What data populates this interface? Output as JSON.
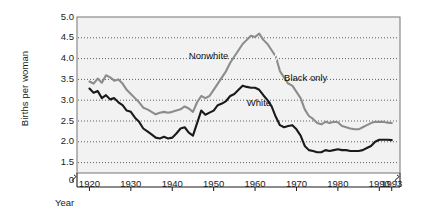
{
  "chart_data": {
    "type": "line",
    "title": "",
    "xlabel": "Year",
    "ylabel": "Births per woman",
    "xlim": [
      1917,
      1995
    ],
    "ylim": [
      1.25,
      5.0
    ],
    "grid": true,
    "legend_position": "inline-annotations",
    "y_axis_break": true,
    "x_ticks": [
      1920,
      1930,
      1940,
      1950,
      1960,
      1970,
      1980,
      1990,
      1993
    ],
    "x_tick_labels": [
      "1920",
      "1930",
      "1940",
      "1950",
      "1960",
      "1970",
      "1980",
      "1990",
      "1993"
    ],
    "y_ticks": [
      0,
      1.5,
      2.0,
      2.5,
      3.0,
      3.5,
      4.0,
      4.5,
      5.0
    ],
    "y_tick_labels": [
      "0",
      "1.5",
      "2.0",
      "2.5",
      "3.0",
      "3.5",
      "4.0",
      "4.5",
      "5.0"
    ],
    "annotations": [
      {
        "text": "Nonwhite",
        "x": 1944,
        "y": 4.05
      },
      {
        "text": "Black only",
        "x": 1967,
        "y": 3.52
      },
      {
        "text": "White",
        "x": 1958,
        "y": 2.92
      }
    ],
    "colors": {
      "nonwhite_black": "#8c8c8c",
      "white": "#1a1a1a",
      "plot_background": "#f2f2f2",
      "grid": "#4d4d4d",
      "frame": "#808080"
    },
    "series": [
      {
        "name": "Nonwhite / Black only",
        "color": "#8c8c8c",
        "note": "Series switches definition from Nonwhite to Black only at 1965 (break mark on line)",
        "x": [
          1920,
          1921,
          1922,
          1923,
          1924,
          1925,
          1926,
          1927,
          1928,
          1929,
          1930,
          1931,
          1932,
          1933,
          1934,
          1935,
          1936,
          1937,
          1938,
          1939,
          1940,
          1941,
          1942,
          1943,
          1944,
          1945,
          1946,
          1947,
          1948,
          1949,
          1950,
          1951,
          1952,
          1953,
          1954,
          1955,
          1956,
          1957,
          1958,
          1959,
          1960,
          1961,
          1962,
          1963,
          1964,
          1965,
          1966,
          1967,
          1968,
          1969,
          1970,
          1971,
          1972,
          1973,
          1974,
          1975,
          1976,
          1977,
          1978,
          1979,
          1980,
          1981,
          1982,
          1983,
          1984,
          1985,
          1986,
          1987,
          1988,
          1989,
          1990,
          1991,
          1992,
          1993
        ],
        "y": [
          3.45,
          3.4,
          3.52,
          3.42,
          3.6,
          3.55,
          3.47,
          3.5,
          3.4,
          3.25,
          3.15,
          3.05,
          2.95,
          2.82,
          2.78,
          2.72,
          2.66,
          2.7,
          2.72,
          2.7,
          2.72,
          2.75,
          2.78,
          2.85,
          2.8,
          2.72,
          2.95,
          3.1,
          3.05,
          3.1,
          3.25,
          3.4,
          3.55,
          3.7,
          3.9,
          4.05,
          4.2,
          4.35,
          4.45,
          4.55,
          4.52,
          4.6,
          4.45,
          4.35,
          4.2,
          4.05,
          3.7,
          3.55,
          3.4,
          3.35,
          3.2,
          3.05,
          2.78,
          2.62,
          2.55,
          2.45,
          2.42,
          2.48,
          2.45,
          2.48,
          2.47,
          2.38,
          2.35,
          2.32,
          2.3,
          2.3,
          2.35,
          2.4,
          2.45,
          2.48,
          2.48,
          2.48,
          2.46,
          2.45
        ]
      },
      {
        "name": "White",
        "color": "#1a1a1a",
        "x": [
          1920,
          1921,
          1922,
          1923,
          1924,
          1925,
          1926,
          1927,
          1928,
          1929,
          1930,
          1931,
          1932,
          1933,
          1934,
          1935,
          1936,
          1937,
          1938,
          1939,
          1940,
          1941,
          1942,
          1943,
          1944,
          1945,
          1946,
          1947,
          1948,
          1949,
          1950,
          1951,
          1952,
          1953,
          1954,
          1955,
          1956,
          1957,
          1958,
          1959,
          1960,
          1961,
          1962,
          1963,
          1964,
          1965,
          1966,
          1967,
          1968,
          1969,
          1970,
          1971,
          1972,
          1973,
          1974,
          1975,
          1976,
          1977,
          1978,
          1979,
          1980,
          1981,
          1982,
          1983,
          1984,
          1985,
          1986,
          1987,
          1988,
          1989,
          1990,
          1991,
          1992,
          1993
        ],
        "y": [
          3.28,
          3.18,
          3.22,
          3.05,
          3.12,
          3.02,
          3.05,
          2.95,
          2.88,
          2.75,
          2.72,
          2.58,
          2.48,
          2.32,
          2.25,
          2.18,
          2.1,
          2.08,
          2.12,
          2.08,
          2.1,
          2.2,
          2.32,
          2.35,
          2.22,
          2.15,
          2.45,
          2.75,
          2.65,
          2.7,
          2.75,
          2.88,
          2.92,
          2.98,
          3.1,
          3.15,
          3.25,
          3.35,
          3.32,
          3.3,
          3.3,
          3.25,
          3.12,
          3.0,
          2.85,
          2.6,
          2.4,
          2.35,
          2.38,
          2.4,
          2.3,
          2.15,
          1.9,
          1.8,
          1.78,
          1.75,
          1.75,
          1.8,
          1.78,
          1.8,
          1.82,
          1.8,
          1.8,
          1.78,
          1.78,
          1.78,
          1.8,
          1.85,
          1.9,
          2.0,
          2.05,
          2.05,
          2.05,
          2.04
        ]
      }
    ]
  },
  "axis": {
    "y_label": "Births per woman",
    "x_label": "Year"
  }
}
